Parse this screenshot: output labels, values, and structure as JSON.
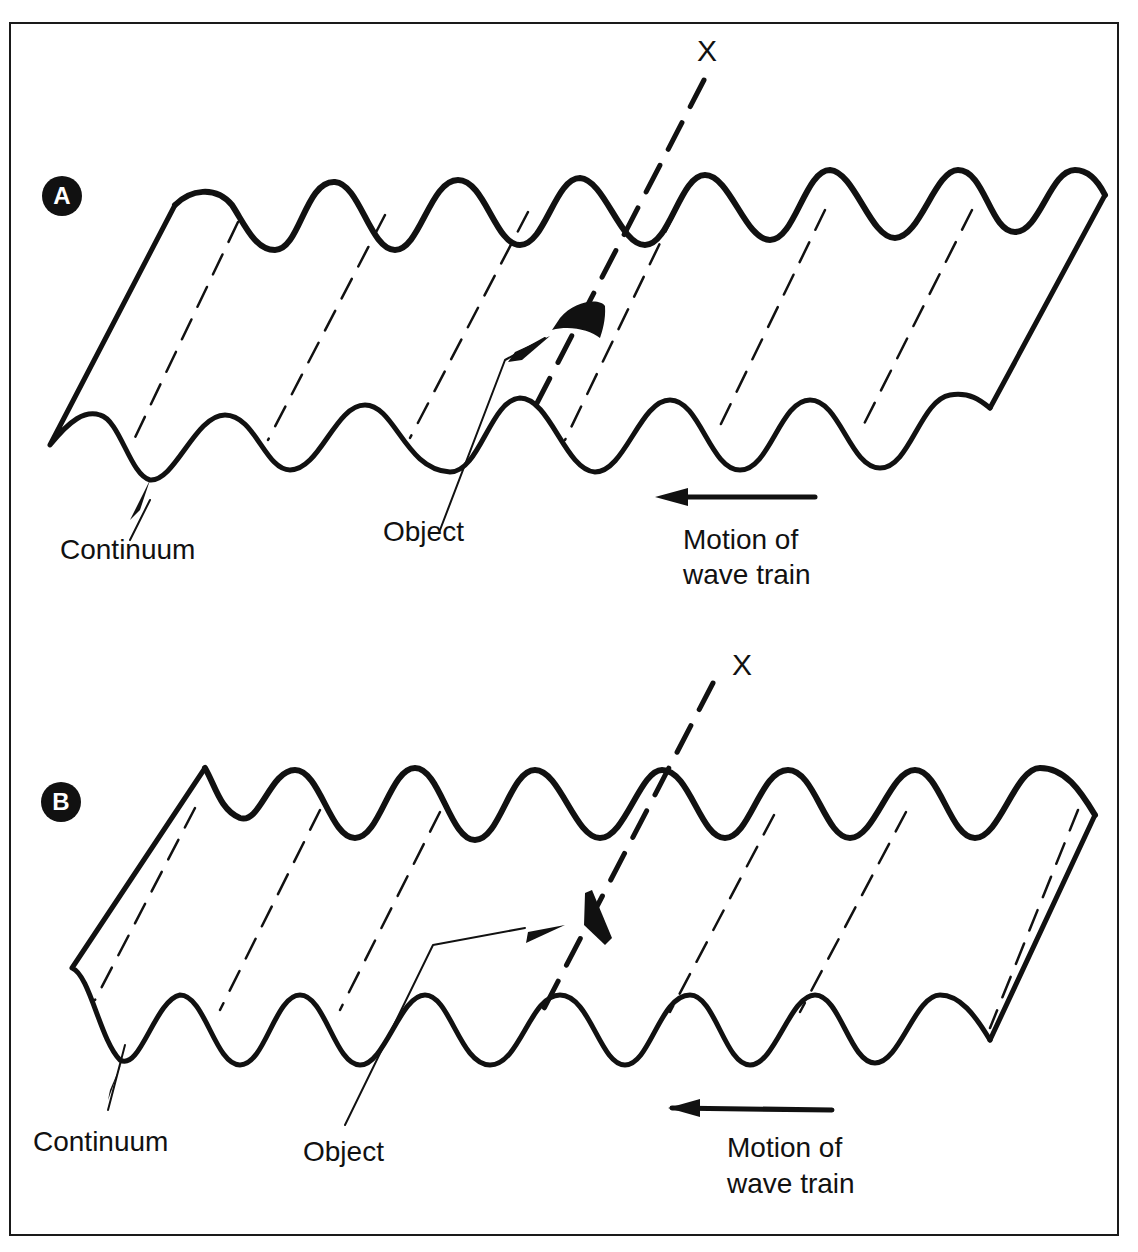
{
  "figure": {
    "panels": [
      {
        "id": "A",
        "badge": "A",
        "axis_label": "X",
        "labels": {
          "continuum": "Continuum",
          "object": "Object",
          "motion_line1": "Motion of",
          "motion_line2": "wave train"
        },
        "object_shape": "curved-block"
      },
      {
        "id": "B",
        "badge": "B",
        "axis_label": "X",
        "labels": {
          "continuum": "Continuum",
          "object": "Object",
          "motion_line1": "Motion of",
          "motion_line2": "wave train"
        },
        "object_shape": "flat-parallelogram"
      }
    ],
    "colors": {
      "ink": "#111111",
      "background": "#ffffff"
    }
  }
}
